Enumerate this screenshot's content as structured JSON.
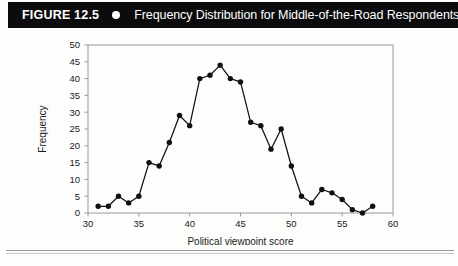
{
  "header": {
    "figure_number": "FIGURE 12.5",
    "dot_icon": "bullet-dot-icon",
    "title": "Frequency Distribution for Middle-of-the-Road Respondents",
    "background_color": "#0c0c0e",
    "text_color": "#ffffff"
  },
  "chart_data": {
    "type": "line",
    "title": "Frequency Distribution for Middle-of-the-Road Respondents",
    "xlabel": "Political viewpoint score",
    "ylabel": "Frequency",
    "xlim": [
      30,
      60
    ],
    "ylim": [
      0,
      50
    ],
    "xticks": [
      30,
      35,
      40,
      45,
      50,
      55,
      60
    ],
    "yticks": [
      0,
      5,
      10,
      15,
      20,
      25,
      30,
      35,
      40,
      45,
      50
    ],
    "grid": false,
    "legend": null,
    "markers": "filled-circle",
    "line_color": "#111111",
    "x": [
      31,
      32,
      33,
      34,
      35,
      36,
      37,
      38,
      39,
      40,
      41,
      42,
      43,
      44,
      45,
      46,
      47,
      48,
      49,
      50,
      51,
      52,
      53,
      54,
      55,
      56,
      57,
      58
    ],
    "y": [
      2,
      2,
      5,
      3,
      5,
      15,
      14,
      21,
      29,
      26,
      40,
      41,
      44,
      40,
      39,
      27,
      26,
      19,
      25,
      14,
      5,
      3,
      7,
      6,
      4,
      1,
      0,
      2
    ],
    "series": [
      {
        "name": "Frequency",
        "values": [
          2,
          2,
          5,
          3,
          5,
          15,
          14,
          21,
          29,
          26,
          40,
          41,
          44,
          40,
          39,
          27,
          26,
          19,
          25,
          14,
          5,
          3,
          7,
          6,
          4,
          1,
          0,
          2
        ]
      }
    ]
  }
}
